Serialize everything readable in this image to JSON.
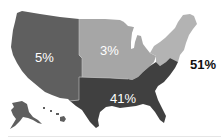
{
  "map": {
    "type": "choropleth",
    "subject": "United States regions",
    "regions": [
      {
        "id": "west",
        "name": "West",
        "value_label": "5%",
        "value": 5,
        "color": "#5f5f5f"
      },
      {
        "id": "midwest",
        "name": "Midwest",
        "value_label": "3%",
        "value": 3,
        "color": "#a6a6a6"
      },
      {
        "id": "northeast",
        "name": "Northeast",
        "value_label": "51%",
        "value": 51,
        "color": "#b3b3b3"
      },
      {
        "id": "south",
        "name": "South",
        "value_label": "41%",
        "value": 41,
        "color": "#404040"
      }
    ],
    "insets": [
      "Alaska",
      "Hawaii"
    ]
  },
  "labels": {
    "west": "5%",
    "midwest": "3%",
    "northeast": "51%",
    "south": "41%"
  }
}
